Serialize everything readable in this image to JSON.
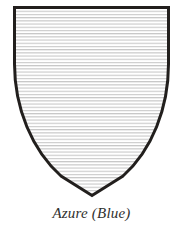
{
  "figure": {
    "kind": "heraldic-tincture-shield",
    "caption": "Azure (Blue)",
    "shield": {
      "tincture_name": "Azure",
      "tincture_common_name": "Blue",
      "hatching_pattern": "horizontal-lines",
      "hatching_meaning": "Azure (Blue)",
      "field_fill_color": "#ffffff",
      "hatch_line_color": "#c8c8c8",
      "outline_color": "#221f1d",
      "outline_width_px": 3,
      "hatch_spacing_px": 3.2,
      "hatch_line_count": 56,
      "geometry": {
        "left_px": 13,
        "right_px": 170,
        "top_px": 6,
        "point_px": 196,
        "point_x_px": 92,
        "shoulder_straight_until_px": 40
      }
    }
  },
  "colors": {
    "background": "#ffffff",
    "ink": "#221f1d",
    "caption_text": "#30302e",
    "hatch": "#c8c8c8"
  }
}
